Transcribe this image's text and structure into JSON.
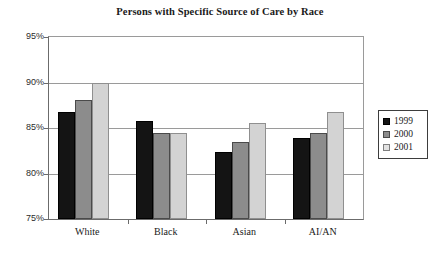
{
  "chart_data": {
    "type": "bar",
    "title": "Persons with Specific Source of Care by Race",
    "xlabel": "",
    "ylabel": "",
    "ylim": [
      75,
      95
    ],
    "ytick_step": 5,
    "ytick_labels": [
      "95%",
      "90%",
      "85%",
      "80%",
      "75%"
    ],
    "ytick_values": [
      95,
      90,
      85,
      80,
      75
    ],
    "grid": true,
    "legend_position": "right",
    "categories": [
      "White",
      "Black",
      "Asian",
      "AI/AN"
    ],
    "series": [
      {
        "name": "1999",
        "color": "#141414",
        "values": [
          86.8,
          85.8,
          82.4,
          83.9
        ]
      },
      {
        "name": "2000",
        "color": "#8c8c8c",
        "values": [
          88.1,
          84.4,
          83.5,
          84.4
        ]
      },
      {
        "name": "2001",
        "color": "#d3d3d3",
        "values": [
          90.0,
          84.4,
          85.6,
          86.8
        ]
      }
    ]
  }
}
